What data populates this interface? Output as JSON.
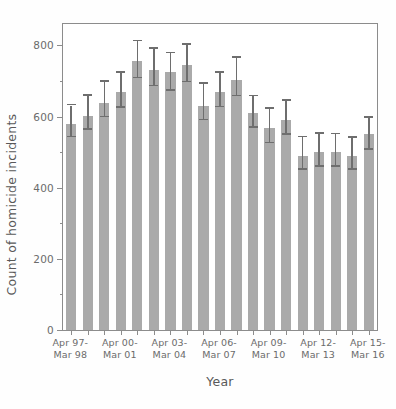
{
  "chart_data": {
    "type": "bar",
    "title": "",
    "xlabel": "Year",
    "ylabel": "Count of homicide incidents",
    "ylim": [
      0,
      860
    ],
    "grid": false,
    "legend": null,
    "y_ticks": [
      0,
      200,
      400,
      600,
      800
    ],
    "y_tick_labels": [
      "0",
      "200",
      "400",
      "600",
      "800"
    ],
    "y_minor_ticks": [
      100,
      300,
      500,
      700
    ],
    "x_tick_labels": [
      "Apr 97-\nMar 98",
      "Apr 00-\nMar 01",
      "Apr 03-\nMar 04",
      "Apr 06-\nMar 07",
      "Apr 09-\nMar 10",
      "Apr 12-\nMar 13",
      "Apr 15-\nMar 16"
    ],
    "x_tick_label_indices": [
      0,
      3,
      6,
      9,
      12,
      15,
      18
    ],
    "categories": [
      "Apr 97-Mar 98",
      "Apr 98-Mar 99",
      "Apr 99-Mar 00",
      "Apr 00-Mar 01",
      "Apr 01-Mar 02",
      "Apr 02-Mar 03",
      "Apr 03-Mar 04",
      "Apr 04-Mar 05",
      "Apr 05-Mar 06",
      "Apr 06-Mar 07",
      "Apr 07-Mar 08",
      "Apr 08-Mar 09",
      "Apr 09-Mar 10",
      "Apr 10-Mar 11",
      "Apr 11-Mar 12",
      "Apr 12-Mar 13",
      "Apr 13-Mar 14",
      "Apr 14-Mar 15",
      "Apr 15-Mar 16"
    ],
    "values": [
      580,
      602,
      638,
      668,
      757,
      730,
      724,
      746,
      630,
      668,
      704,
      611,
      568,
      591,
      488,
      500,
      500,
      488,
      550
    ],
    "error_low": [
      542,
      563,
      598,
      625,
      707,
      685,
      673,
      696,
      589,
      626,
      657,
      568,
      525,
      548,
      450,
      458,
      458,
      450,
      507
    ],
    "error_high": [
      631,
      659,
      698,
      723,
      812,
      790,
      778,
      802,
      692,
      723,
      765,
      657,
      621,
      645,
      542,
      551,
      550,
      540,
      597
    ],
    "bar_color": "#aaaaaa",
    "error_color": "#6e6e6e",
    "axis_color": "#8c8c8c",
    "text_color": "#595959"
  }
}
